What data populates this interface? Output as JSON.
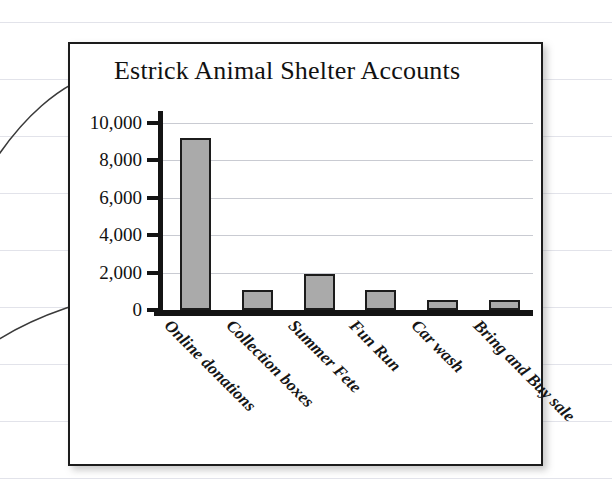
{
  "figure": {
    "title": "Estrick Animal Shelter Accounts",
    "frame_color": "#1c1c1c",
    "background": "#ffffff"
  },
  "annotations": {
    "title_pointer": "leader-line-to-title",
    "axis_pointer": "leader-line-to-y-axis"
  },
  "chart_data": {
    "type": "bar",
    "title": "Estrick Animal Shelter Accounts",
    "xlabel": "",
    "ylabel": "",
    "categories": [
      "Online donations",
      "Collection boxes",
      "Summer Fete",
      "Fun Run",
      "Car wash",
      "Bring and Buy sale"
    ],
    "values": [
      9200,
      1050,
      1950,
      1050,
      550,
      550
    ],
    "ylim": [
      0,
      10000
    ],
    "yticks": [
      0,
      2000,
      4000,
      6000,
      8000,
      10000
    ],
    "ytick_labels": [
      "0",
      "2,000",
      "4,000",
      "6,000",
      "8,000",
      "10,000"
    ],
    "grid": true,
    "legend": false,
    "bar_fill": "#aaaaaa",
    "bar_edge": "#1c1c1c",
    "grid_color": "#c9cbd2",
    "axis_color": "#141414"
  }
}
